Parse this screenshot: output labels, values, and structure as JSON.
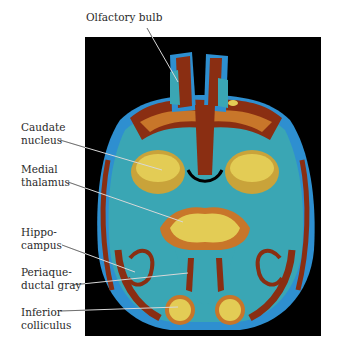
{
  "figure": {
    "background_color": "#000000",
    "palette": {
      "rust": "#8a2e12",
      "orange": "#c8762a",
      "blue": "#2e8fd0",
      "teal": "#3aa6b4",
      "yellow": "#e3cc55",
      "leader_line": "#d8d8d8"
    }
  },
  "labels": [
    {
      "id": "olfactory-bulb",
      "text": "Olfactory bulb"
    },
    {
      "id": "caudate-nucleus",
      "text": "Caudate\nnucleus"
    },
    {
      "id": "medial-thalamus",
      "text": "Medial\nthalamus"
    },
    {
      "id": "hippocampus",
      "text": "Hippo-\ncampus"
    },
    {
      "id": "periaqueductal-gray",
      "text": "Periaque-\nductal gray"
    },
    {
      "id": "inferior-colliculus",
      "text": "Inferior\ncolliculus"
    }
  ]
}
